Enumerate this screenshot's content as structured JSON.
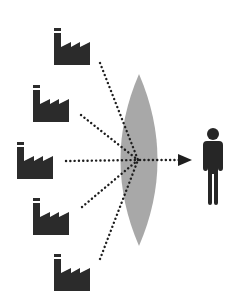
{
  "diagram": {
    "colors": {
      "icon": "#2b2b2b",
      "lens": "#a8a8a8",
      "dots": "#1e1e1e",
      "background": "#ffffff"
    },
    "factories": [
      {
        "id": 1,
        "icon": "factory-icon",
        "x": 54,
        "y": 28
      },
      {
        "id": 2,
        "icon": "factory-icon",
        "x": 33,
        "y": 85
      },
      {
        "id": 3,
        "icon": "factory-icon",
        "x": 17,
        "y": 142
      },
      {
        "id": 4,
        "icon": "factory-icon",
        "x": 33,
        "y": 198
      },
      {
        "id": 5,
        "icon": "factory-icon",
        "x": 54,
        "y": 254
      }
    ],
    "lens": {
      "icon": "lens-shape",
      "cx": 139,
      "top": 74,
      "bottom": 246,
      "half_width": 19
    },
    "focal_point": {
      "x": 138,
      "y": 160
    },
    "arrow": {
      "icon": "arrow-right-icon",
      "from_x": 138,
      "to_x": 190,
      "y": 160
    },
    "person": {
      "icon": "person-icon",
      "x": 199,
      "y": 128
    }
  }
}
